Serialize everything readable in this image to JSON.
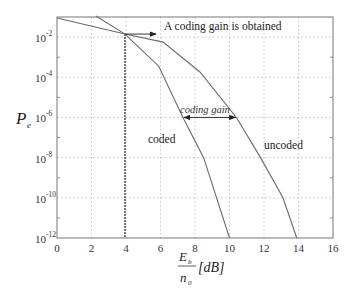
{
  "chart_data": {
    "type": "line",
    "title": "",
    "xlabel": "Eb/n0 [dB]",
    "ylabel": "Pe",
    "xlim": [
      0,
      16
    ],
    "ylim_log10": [
      -12,
      -1
    ],
    "yscale": "log",
    "grid": true,
    "x_ticks": [
      0,
      2,
      4,
      6,
      8,
      10,
      12,
      14,
      16
    ],
    "y_ticks_log10": [
      -2,
      -4,
      -6,
      -8,
      -10,
      -12
    ],
    "series": [
      {
        "name": "uncoded",
        "x": [
          0,
          3.94,
          6.15,
          8.3,
          10.4,
          11.8,
          13.1,
          13.9
        ],
        "log10_y": [
          -1.05,
          -1.85,
          -2.25,
          -3.75,
          -6,
          -8,
          -10,
          -12
        ]
      },
      {
        "name": "coded",
        "x": [
          2.26,
          3.94,
          5.9,
          7.3,
          8.5,
          10.0
        ],
        "log10_y": [
          -0.95,
          -1.85,
          -3.45,
          -6,
          -8,
          -12
        ]
      }
    ],
    "annotations": [
      {
        "text": "A coding gain is obtained",
        "x": 3.94,
        "log10_y": -1.85,
        "type": "arrow-right"
      },
      {
        "text": "coding gain",
        "x_from": 7.3,
        "x_to": 10.4,
        "log10_y": -6,
        "type": "double-arrow"
      },
      {
        "text": "coded",
        "x": 5.3,
        "log10_y": -7.1
      },
      {
        "text": "uncoded",
        "x": 12.0,
        "log10_y": -7.4
      },
      {
        "type": "vertical-line",
        "x": 3.94,
        "from_log10_y": -1.85,
        "to_log10_y": -12
      }
    ]
  },
  "labels": {
    "y_axis_main": "P",
    "y_axis_sub": "e",
    "x_axis_num_main": "E",
    "x_axis_num_sub": "b",
    "x_axis_den_main": "n",
    "x_axis_den_sub": "0",
    "x_axis_unit": "[dB]",
    "annot_gain_obtained": "A coding gain is obtained",
    "annot_coding_gain": "coding gain",
    "label_coded": "coded",
    "label_uncoded": "uncoded",
    "tick_base": "10"
  },
  "colors": {
    "curve": "#6a6a6a",
    "frame": "#777777",
    "grid": "#b8b8b8",
    "vline": "#555555",
    "arrow": "#222222"
  }
}
